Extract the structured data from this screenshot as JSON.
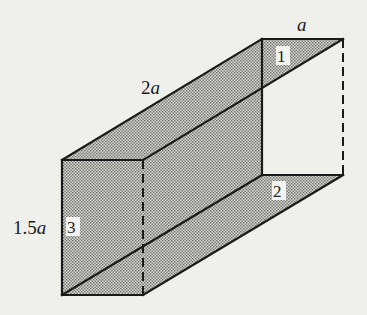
{
  "figure": {
    "type": "isometric rectangular duct (box) with shaded faces",
    "dimension_labels": {
      "width": {
        "coef": "",
        "var": "a"
      },
      "length": {
        "coef": "2",
        "var": "a"
      },
      "height": {
        "coef": "1.5",
        "var": "a"
      }
    },
    "face_labels": [
      "1",
      "2",
      "3"
    ],
    "colors": {
      "background": "#efefec",
      "stroke": "#1a1a1a",
      "shade": "#9a9a96"
    }
  }
}
